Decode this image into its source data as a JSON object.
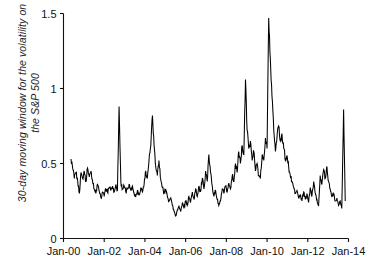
{
  "chart_data": {
    "type": "line",
    "title": "",
    "subtitle": "",
    "xlabel": "",
    "ylabel": "30-day moving window for the volatility on\nthe S&P 500",
    "legend": [],
    "legend_position": "none",
    "grid": false,
    "xlim": [
      2000.0,
      2014.0
    ],
    "ylim": [
      0,
      1.5
    ],
    "xticks": [
      "Jan-00",
      "Jan-02",
      "Jan-04",
      "Jan-06",
      "Jan-08",
      "Jan-10",
      "Jan-12",
      "Jan-14"
    ],
    "xtick_values": [
      2000,
      2002,
      2004,
      2006,
      2008,
      2010,
      2012,
      2014
    ],
    "yticks": [
      "0",
      "0.5",
      "1",
      "1.5"
    ],
    "ytick_values": [
      0,
      0.5,
      1,
      1.5
    ],
    "series_name": "30-day moving volatility",
    "color": "#000000",
    "x": [
      2000.37,
      2000.45,
      2000.53,
      2000.61,
      2000.7,
      2000.78,
      2000.86,
      2000.94,
      2001.02,
      2001.1,
      2001.18,
      2001.27,
      2001.35,
      2001.43,
      2001.51,
      2001.59,
      2001.67,
      2001.76,
      2001.84,
      2001.92,
      2002.0,
      2002.08,
      2002.16,
      2002.24,
      2002.33,
      2002.41,
      2002.49,
      2002.57,
      2002.65,
      2002.73,
      2002.82,
      2002.9,
      2002.98,
      2003.06,
      2003.14,
      2003.22,
      2003.31,
      2003.39,
      2003.47,
      2003.55,
      2003.63,
      2003.71,
      2003.8,
      2003.88,
      2003.96,
      2004.04,
      2004.12,
      2004.2,
      2004.29,
      2004.37,
      2004.45,
      2004.53,
      2004.61,
      2004.69,
      2004.78,
      2004.86,
      2004.94,
      2005.02,
      2005.1,
      2005.18,
      2005.27,
      2005.35,
      2005.43,
      2005.51,
      2005.59,
      2005.67,
      2005.76,
      2005.84,
      2005.92,
      2006.0,
      2006.08,
      2006.16,
      2006.24,
      2006.33,
      2006.41,
      2006.49,
      2006.57,
      2006.65,
      2006.73,
      2006.82,
      2006.9,
      2006.98,
      2007.06,
      2007.14,
      2007.22,
      2007.31,
      2007.39,
      2007.47,
      2007.55,
      2007.63,
      2007.71,
      2007.8,
      2007.88,
      2007.96,
      2008.04,
      2008.12,
      2008.2,
      2008.29,
      2008.37,
      2008.45,
      2008.53,
      2008.61,
      2008.69,
      2008.78,
      2008.86,
      2008.94,
      2009.02,
      2009.1,
      2009.18,
      2009.27,
      2009.35,
      2009.43,
      2009.51,
      2009.59,
      2009.67,
      2009.76,
      2009.84,
      2009.92,
      2010.0,
      2010.08,
      2010.16,
      2010.24,
      2010.33,
      2010.41,
      2010.49,
      2010.57,
      2010.65,
      2010.73,
      2010.82,
      2010.9,
      2010.98,
      2011.06,
      2011.14,
      2011.22,
      2011.31,
      2011.39,
      2011.47,
      2011.55,
      2011.63,
      2011.71,
      2011.8,
      2011.88,
      2011.96,
      2012.04,
      2012.12,
      2012.2,
      2012.29,
      2012.37,
      2012.45,
      2012.53,
      2012.61,
      2012.69,
      2012.78,
      2012.86,
      2012.94,
      2013.02,
      2013.1,
      2013.18,
      2013.27,
      2013.35,
      2013.43,
      2013.51,
      2013.59,
      2013.67,
      2013.76,
      2013.84
    ],
    "y": [
      0.53,
      0.47,
      0.4,
      0.44,
      0.38,
      0.3,
      0.44,
      0.4,
      0.45,
      0.38,
      0.47,
      0.41,
      0.45,
      0.38,
      0.33,
      0.3,
      0.36,
      0.31,
      0.27,
      0.31,
      0.28,
      0.33,
      0.31,
      0.34,
      0.32,
      0.35,
      0.31,
      0.36,
      0.32,
      0.88,
      0.37,
      0.33,
      0.35,
      0.31,
      0.33,
      0.36,
      0.32,
      0.35,
      0.3,
      0.28,
      0.32,
      0.29,
      0.34,
      0.31,
      0.36,
      0.45,
      0.4,
      0.52,
      0.62,
      0.82,
      0.62,
      0.48,
      0.42,
      0.52,
      0.39,
      0.34,
      0.3,
      0.33,
      0.28,
      0.25,
      0.27,
      0.22,
      0.18,
      0.15,
      0.19,
      0.22,
      0.18,
      0.24,
      0.2,
      0.25,
      0.22,
      0.28,
      0.24,
      0.31,
      0.26,
      0.33,
      0.28,
      0.35,
      0.31,
      0.4,
      0.33,
      0.45,
      0.38,
      0.56,
      0.44,
      0.35,
      0.28,
      0.32,
      0.26,
      0.22,
      0.25,
      0.33,
      0.3,
      0.35,
      0.31,
      0.37,
      0.33,
      0.42,
      0.38,
      0.5,
      0.44,
      0.58,
      0.5,
      0.62,
      0.56,
      1.06,
      0.72,
      0.6,
      0.65,
      0.52,
      0.58,
      0.45,
      0.5,
      0.42,
      0.4,
      0.56,
      0.52,
      0.67,
      0.6,
      1.47,
      1.2,
      0.95,
      0.72,
      0.58,
      0.68,
      0.75,
      0.65,
      0.7,
      0.6,
      0.52,
      0.55,
      0.48,
      0.42,
      0.38,
      0.34,
      0.3,
      0.32,
      0.27,
      0.29,
      0.25,
      0.31,
      0.26,
      0.3,
      0.24,
      0.34,
      0.28,
      0.38,
      0.3,
      0.26,
      0.22,
      0.42,
      0.36,
      0.46,
      0.4,
      0.48,
      0.38,
      0.33,
      0.28,
      0.3,
      0.25,
      0.27,
      0.22,
      0.25,
      0.2,
      0.86,
      0.25
    ]
  }
}
